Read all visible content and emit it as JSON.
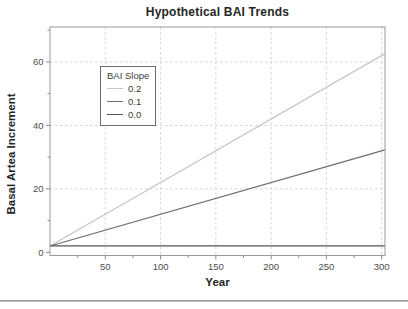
{
  "chart_data": {
    "type": "line",
    "title": "Hypothetical BAI Trends",
    "xlabel": "Year",
    "ylabel": "Basal Artea Increment",
    "xlim": [
      0,
      303
    ],
    "ylim": [
      -1,
      71
    ],
    "x_ticks_major": [
      50,
      100,
      150,
      200,
      250,
      300
    ],
    "x_ticks_minor": [
      25,
      75,
      125,
      175,
      225,
      275
    ],
    "y_ticks_major": [
      0,
      20,
      40,
      60
    ],
    "y_ticks_minor": [
      10,
      30,
      50,
      70
    ],
    "grid": "dashed gridlines at major ticks, both axes",
    "frame": "full box frame around plot area",
    "colors": {
      "gridline": "#cfcfcf",
      "frame": "#9a9a9a",
      "tick": "#8c8c8c",
      "tick_label": "#4d4d4d"
    },
    "legend": {
      "title": "BAI Slope",
      "position": "upper-left inside plot",
      "entries": [
        {
          "label": "0.2",
          "color": "#c6c6c6"
        },
        {
          "label": "0.1",
          "color": "#6e6e6e"
        },
        {
          "label": "0.0",
          "color": "#555555"
        }
      ]
    },
    "series": [
      {
        "name": "0.2",
        "slope": 0.2,
        "intercept": 2,
        "color": "#c6c6c6",
        "x": [
          0,
          303
        ],
        "values": [
          2,
          62.6
        ]
      },
      {
        "name": "0.1",
        "slope": 0.1,
        "intercept": 2,
        "color": "#6e6e6e",
        "x": [
          0,
          303
        ],
        "values": [
          2,
          32.3
        ]
      },
      {
        "name": "0.0",
        "slope": 0.0,
        "intercept": 2,
        "color": "#555555",
        "x": [
          0,
          303
        ],
        "values": [
          2,
          2
        ]
      }
    ]
  }
}
